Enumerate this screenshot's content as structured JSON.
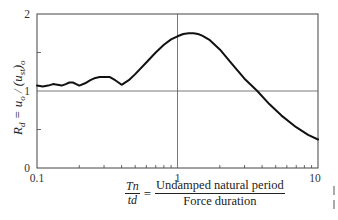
{
  "chart_data": {
    "type": "line",
    "title": "",
    "xlabel": "Tn / td = Undamped natural period / Force duration",
    "ylabel": "Rd = uo / (ust)o",
    "xscale": "log",
    "xlim": [
      0.1,
      10
    ],
    "ylim": [
      0,
      2
    ],
    "x_ticks": [
      "0.1",
      "1",
      "10"
    ],
    "y_ticks": [
      "0",
      "1",
      "2"
    ],
    "grid": {
      "vertical_at": [
        1
      ],
      "horizontal_at": [
        1
      ]
    },
    "legend": null,
    "series": [
      {
        "name": "Rd",
        "x": [
          0.1,
          0.11,
          0.12,
          0.13,
          0.14,
          0.15,
          0.16,
          0.17,
          0.18,
          0.19,
          0.2,
          0.22,
          0.24,
          0.26,
          0.28,
          0.3,
          0.33,
          0.36,
          0.38,
          0.4,
          0.45,
          0.5,
          0.6,
          0.7,
          0.8,
          0.9,
          1.0,
          1.1,
          1.2,
          1.3,
          1.4,
          1.5,
          1.7,
          2.0,
          2.5,
          3.0,
          3.7,
          4.5,
          5.5,
          7.0,
          8.5,
          10.0
        ],
        "y": [
          1.07,
          1.06,
          1.07,
          1.09,
          1.08,
          1.07,
          1.09,
          1.11,
          1.11,
          1.09,
          1.07,
          1.1,
          1.14,
          1.17,
          1.18,
          1.18,
          1.18,
          1.14,
          1.11,
          1.08,
          1.14,
          1.22,
          1.37,
          1.5,
          1.6,
          1.67,
          1.71,
          1.74,
          1.75,
          1.75,
          1.74,
          1.72,
          1.66,
          1.54,
          1.33,
          1.16,
          1.0,
          0.83,
          0.68,
          0.53,
          0.43,
          0.37
        ]
      }
    ]
  },
  "axes": {
    "y_tick_labels": [
      "2",
      "1",
      "0"
    ],
    "x_tick_labels": [
      "0.1",
      "1",
      "10"
    ],
    "y_axis_label_main": "R",
    "y_axis_label_sub": "d",
    "y_axis_label_rest": " = u",
    "y_axis_label_sub2": "o",
    "y_axis_label_rest2": " / (u",
    "y_axis_label_sub3": "st",
    "y_axis_label_rest3": ")",
    "y_axis_label_sub4": "o"
  },
  "x_label": {
    "lhs_numerator": "Tn",
    "lhs_denominator": "td",
    "equals": "=",
    "rhs_numerator": "Undamped natural period",
    "rhs_denominator": "Force duration"
  }
}
